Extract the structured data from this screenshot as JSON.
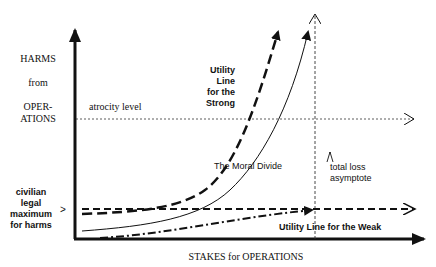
{
  "diagram": {
    "y_axis_label_lines": [
      "HARMS",
      "from",
      "OPER-",
      "ATIONS"
    ],
    "x_axis_label": "STAKES for OPERATIONS",
    "atrocity_label": "atrocity level",
    "civilian_label_lines": [
      "civilian",
      "legal",
      "maximum",
      "for harms"
    ],
    "strong_label_lines": [
      "Utility",
      "Line",
      "for the",
      "Strong"
    ],
    "moral_divide_label": "The Moral Divide",
    "total_loss_label_lines": [
      "total loss",
      "asymptote"
    ],
    "weak_label": "Utility Line for the Weak",
    "civilian_marker": ">"
  }
}
